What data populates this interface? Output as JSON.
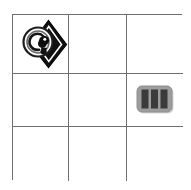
{
  "canvas": {
    "width": 191,
    "height": 190,
    "background_color": "#ffffff"
  },
  "grid": {
    "name": "three-by-three-icon-grid",
    "rows": 3,
    "columns": 3,
    "line_color": "#6f6f6f",
    "line_width_px": 1,
    "cell_background": "#ffffff",
    "left_px": 12,
    "top_px": 14,
    "width_px": 170,
    "height_px": 166,
    "cells": [
      {
        "row": 0,
        "col": 0,
        "icon": "diamond-eye-icon",
        "label": "",
        "empty": false
      },
      {
        "row": 0,
        "col": 1,
        "icon": "",
        "label": "",
        "empty": true
      },
      {
        "row": 0,
        "col": 2,
        "icon": "",
        "label": "",
        "empty": true
      },
      {
        "row": 1,
        "col": 0,
        "icon": "",
        "label": "",
        "empty": true
      },
      {
        "row": 1,
        "col": 1,
        "icon": "",
        "label": "",
        "empty": true
      },
      {
        "row": 1,
        "col": 2,
        "icon": "barcode-icon",
        "label": "",
        "empty": false
      },
      {
        "row": 2,
        "col": 0,
        "icon": "",
        "label": "",
        "empty": true
      },
      {
        "row": 2,
        "col": 1,
        "icon": "",
        "label": "",
        "empty": true
      },
      {
        "row": 2,
        "col": 2,
        "icon": "",
        "label": "",
        "empty": true
      }
    ]
  },
  "icons": {
    "diamond_eye": {
      "name": "diamond-eye-icon",
      "description": "black diamond with overlapping circular spiral eye motif",
      "fill_color": "#1a1a1a",
      "outline_color": "#000000",
      "highlight_color": "#ffffff",
      "mid_gray": "#8c8c8c"
    },
    "barcode": {
      "name": "barcode-icon",
      "description": "gray rounded rectangle with three dark vertical bars",
      "body_color": "#9a9a9a",
      "bar_color": "#3c3c3c",
      "shadow_color": "#cfcfcf",
      "bar_count": 3
    }
  }
}
